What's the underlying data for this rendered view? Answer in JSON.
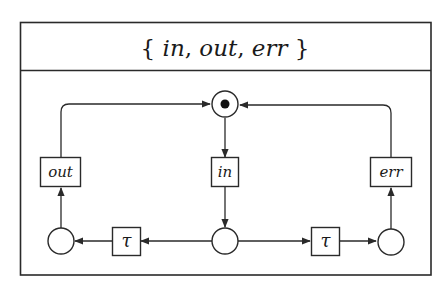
{
  "diagram": {
    "type": "petri-net",
    "title": {
      "open_brace": "{",
      "items": [
        "in",
        "out",
        "err"
      ],
      "separator": ", ",
      "close_brace": "}",
      "full_text": "{ in, out, err }"
    },
    "places": [
      {
        "id": "p_top",
        "marked": true,
        "tokens": 1
      },
      {
        "id": "p_left",
        "marked": false,
        "tokens": 0
      },
      {
        "id": "p_mid",
        "marked": false,
        "tokens": 0
      },
      {
        "id": "p_right",
        "marked": false,
        "tokens": 0
      }
    ],
    "transitions": [
      {
        "id": "t_out",
        "label": "out"
      },
      {
        "id": "t_in",
        "label": "in"
      },
      {
        "id": "t_err",
        "label": "err"
      },
      {
        "id": "t_tau_left",
        "label": "τ"
      },
      {
        "id": "t_tau_right",
        "label": "τ"
      }
    ],
    "arcs": [
      {
        "from": "p_top",
        "to": "t_in"
      },
      {
        "from": "t_in",
        "to": "p_mid"
      },
      {
        "from": "p_mid",
        "to": "t_tau_left"
      },
      {
        "from": "t_tau_left",
        "to": "p_left"
      },
      {
        "from": "p_left",
        "to": "t_out"
      },
      {
        "from": "t_out",
        "to": "p_top"
      },
      {
        "from": "p_mid",
        "to": "t_tau_right"
      },
      {
        "from": "t_tau_right",
        "to": "p_right"
      },
      {
        "from": "p_right",
        "to": "t_err"
      },
      {
        "from": "t_err",
        "to": "p_top"
      }
    ],
    "colors": {
      "stroke": "#2a2a2a",
      "background": "#ffffff",
      "token": "#111111"
    }
  }
}
